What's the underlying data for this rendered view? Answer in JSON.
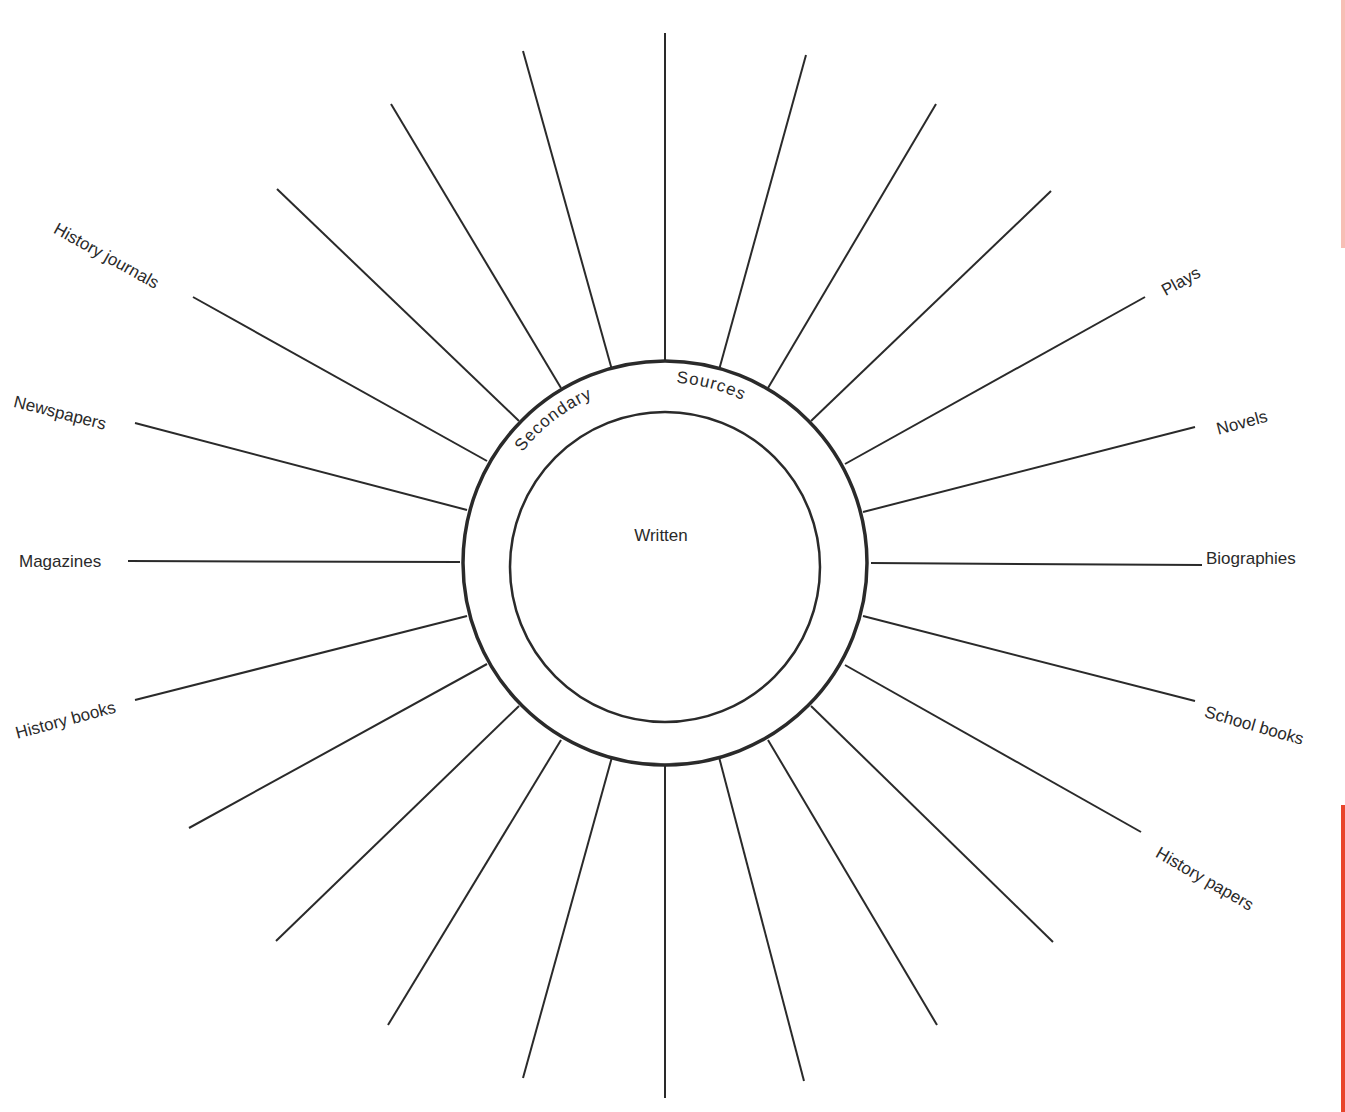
{
  "diagram": {
    "center": {
      "x": 665,
      "y": 563
    },
    "outer_radius": 202,
    "inner_radius": 155,
    "ring_label_left": "Secondary",
    "ring_label_right": "Sources",
    "center_label": "Written",
    "line_color": "#2a2a2a",
    "accent_color": "#e8452c",
    "spokes": [
      {
        "x1": 665,
        "y1": 363,
        "x2": 665,
        "y2": 33
      },
      {
        "x1": 719,
        "y1": 370,
        "x2": 806,
        "y2": 55
      },
      {
        "x1": 768,
        "y1": 388,
        "x2": 936,
        "y2": 104
      },
      {
        "x1": 811,
        "y1": 421,
        "x2": 1051,
        "y2": 191
      },
      {
        "x1": 845,
        "y1": 464,
        "x2": 1145,
        "y2": 297
      },
      {
        "x1": 863,
        "y1": 512,
        "x2": 1195,
        "y2": 427
      },
      {
        "x1": 871,
        "y1": 563,
        "x2": 1202,
        "y2": 565
      },
      {
        "x1": 863,
        "y1": 616,
        "x2": 1195,
        "y2": 701
      },
      {
        "x1": 845,
        "y1": 665,
        "x2": 1141,
        "y2": 832
      },
      {
        "x1": 811,
        "y1": 706,
        "x2": 1053,
        "y2": 942
      },
      {
        "x1": 768,
        "y1": 740,
        "x2": 937,
        "y2": 1025
      },
      {
        "x1": 719,
        "y1": 757,
        "x2": 804,
        "y2": 1081
      },
      {
        "x1": 665,
        "y1": 764,
        "x2": 665,
        "y2": 1098
      },
      {
        "x1": 612,
        "y1": 757,
        "x2": 523,
        "y2": 1078
      },
      {
        "x1": 561,
        "y1": 740,
        "x2": 388,
        "y2": 1025
      },
      {
        "x1": 519,
        "y1": 706,
        "x2": 276,
        "y2": 941
      },
      {
        "x1": 487,
        "y1": 664,
        "x2": 189,
        "y2": 828
      },
      {
        "x1": 467,
        "y1": 616,
        "x2": 135,
        "y2": 700
      },
      {
        "x1": 460,
        "y1": 562,
        "x2": 128,
        "y2": 561
      },
      {
        "x1": 467,
        "y1": 510,
        "x2": 135,
        "y2": 423
      },
      {
        "x1": 487,
        "y1": 461,
        "x2": 193,
        "y2": 297
      },
      {
        "x1": 519,
        "y1": 421,
        "x2": 277,
        "y2": 189
      },
      {
        "x1": 561,
        "y1": 388,
        "x2": 391,
        "y2": 104
      },
      {
        "x1": 612,
        "y1": 370,
        "x2": 523,
        "y2": 51
      }
    ],
    "labels": [
      {
        "text": "History journals",
        "x": 55,
        "y": 228,
        "rotate": 29
      },
      {
        "text": "Newspapers",
        "x": 14,
        "y": 402,
        "rotate": 14
      },
      {
        "text": "Magazines",
        "x": 19,
        "y": 562,
        "rotate": 0
      },
      {
        "text": "History books",
        "x": 16,
        "y": 734,
        "rotate": -15
      },
      {
        "text": "Plays",
        "x": 1163,
        "y": 292,
        "rotate": -29
      },
      {
        "text": "Novels",
        "x": 1217,
        "y": 430,
        "rotate": -15
      },
      {
        "text": "Biographies",
        "x": 1206,
        "y": 559,
        "rotate": 0
      },
      {
        "text": "School books",
        "x": 1205,
        "y": 712,
        "rotate": 16
      },
      {
        "text": "History papers",
        "x": 1157,
        "y": 852,
        "rotate": 30
      }
    ]
  }
}
